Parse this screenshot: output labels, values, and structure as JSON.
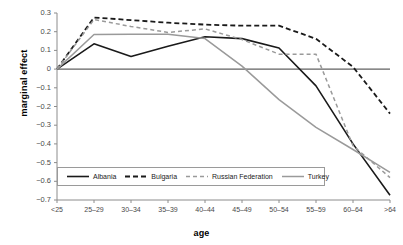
{
  "chart_data": {
    "type": "line",
    "title": "",
    "xlabel": "age",
    "ylabel": "marginal effect",
    "categories": [
      "<25",
      "25–29",
      "30–34",
      "35–39",
      "40–44",
      "45–49",
      "50–54",
      "55–59",
      "60–64",
      ">64"
    ],
    "ylim": [
      -0.7,
      0.3
    ],
    "yticks": [
      0.3,
      0.2,
      0.1,
      0,
      -0.1,
      -0.2,
      -0.3,
      -0.4,
      -0.5,
      -0.6,
      -0.7
    ],
    "ytick_labels": [
      "0.3",
      "0.2",
      "0.1",
      "0",
      "−0.1",
      "−0.2",
      "−0.3",
      "−0.4",
      "−0.5",
      "−0.6",
      "−0.7"
    ],
    "grid": false,
    "zero_line": true,
    "legend_position": "bottom-left-inside",
    "series": [
      {
        "name": "Albania",
        "color": "#1a1a1a",
        "style": "solid",
        "width": 1.6,
        "values": [
          0,
          0.135,
          0.067,
          0.122,
          0.173,
          0.163,
          0.113,
          -0.09,
          -0.4,
          -0.675
        ]
      },
      {
        "name": "Bulgaria",
        "color": "#1a1a1a",
        "style": "dashed",
        "width": 1.8,
        "values": [
          0,
          0.276,
          0.262,
          0.248,
          0.238,
          0.232,
          0.232,
          0.162,
          0.012,
          -0.238
        ]
      },
      {
        "name": "Russian Federation",
        "color": "#9a9a9a",
        "style": "dashed",
        "width": 1.5,
        "values": [
          0,
          0.265,
          0.228,
          0.196,
          0.215,
          0.158,
          0.08,
          0.08,
          -0.41,
          -0.58
        ]
      },
      {
        "name": "Turkey",
        "color": "#9a9a9a",
        "style": "solid",
        "width": 1.5,
        "values": [
          0,
          0.185,
          0.186,
          0.186,
          0.163,
          0.016,
          -0.163,
          -0.312,
          -0.43,
          -0.552
        ]
      }
    ]
  },
  "axes": {
    "ylabel": "marginal effect",
    "xlabel": "age"
  }
}
